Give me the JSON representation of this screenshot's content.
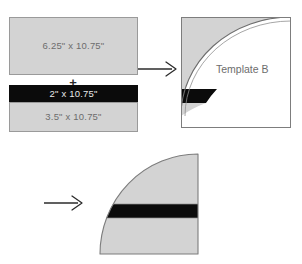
{
  "diagram": {
    "colors": {
      "fabric_gray": "#d3d3d3",
      "fabric_black": "#0b0b0b",
      "outline": "#9a9a9a",
      "label_text": "#6d6d6d",
      "background": "#ffffff"
    }
  },
  "strips": {
    "top": {
      "label": "6.25\" x 10.75\"",
      "fabric": "gray"
    },
    "plus": {
      "label": "+"
    },
    "middle": {
      "label": "2\" x 10.75\"",
      "fabric": "black"
    },
    "bottom": {
      "label": "3.5\" x 10.75\"",
      "fabric": "gray"
    }
  },
  "arrows": {
    "first": {
      "direction": "right"
    },
    "second": {
      "direction": "right"
    }
  },
  "template": {
    "caption": "Template B",
    "shape": "square-with-quarter-circle-cut"
  },
  "result": {
    "shape": "quarter-circle-wedge-with-black-band"
  }
}
